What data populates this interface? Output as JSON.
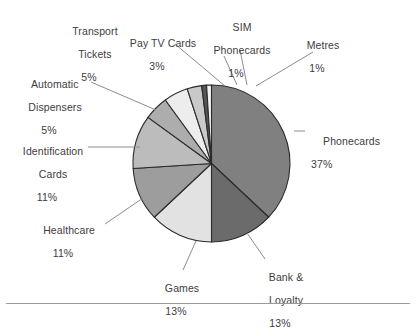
{
  "chart_data": {
    "type": "pie",
    "title": "",
    "subtitle": "",
    "xlabel": "",
    "ylabel": "",
    "legend_position": "none",
    "grid": false,
    "units": "percent",
    "total": 100,
    "start_angle_deg": 0,
    "direction": "clockwise",
    "categories": [
      "Phonecards",
      "Bank & Loyalty",
      "Games",
      "Healthcare",
      "Identification Cards",
      "Automatic Dispensers",
      "Transport Tickets",
      "Pay TV Cards",
      "SIM Phonecards",
      "Metres"
    ],
    "values": [
      37,
      13,
      13,
      11,
      11,
      5,
      5,
      3,
      1,
      1
    ],
    "slices": [
      {
        "name": "Phonecards",
        "label_line1": "Phonecards",
        "label_line2": "",
        "value": 37,
        "pct_text": "37%",
        "color": "#808080"
      },
      {
        "name": "Bank & Loyalty",
        "label_line1": "Bank &",
        "label_line2": "Loyalty",
        "value": 13,
        "pct_text": "13%",
        "color": "#6b6b6b"
      },
      {
        "name": "Games",
        "label_line1": "Games",
        "label_line2": "",
        "value": 13,
        "pct_text": "13%",
        "color": "#e2e2e2"
      },
      {
        "name": "Healthcare",
        "label_line1": "Healthcare",
        "label_line2": "",
        "value": 11,
        "pct_text": "11%",
        "color": "#9d9d9d"
      },
      {
        "name": "Identification Cards",
        "label_line1": "Identification",
        "label_line2": "Cards",
        "value": 11,
        "pct_text": "11%",
        "color": "#bcbcbc"
      },
      {
        "name": "Automatic Dispensers",
        "label_line1": "Automatic",
        "label_line2": "Dispensers",
        "value": 5,
        "pct_text": "5%",
        "color": "#adadad"
      },
      {
        "name": "Transport Tickets",
        "label_line1": "Transport",
        "label_line2": "Tickets",
        "value": 5,
        "pct_text": "5%",
        "color": "#ededed"
      },
      {
        "name": "Pay TV Cards",
        "label_line1": "Pay TV Cards",
        "label_line2": "",
        "value": 3,
        "pct_text": "3%",
        "color": "#c9c9c9"
      },
      {
        "name": "SIM Phonecards",
        "label_line1": "SIM",
        "label_line2": "Phonecards",
        "value": 1,
        "pct_text": "1%",
        "color": "#555555"
      },
      {
        "name": "Metres",
        "label_line1": "Metres",
        "label_line2": "",
        "value": 1,
        "pct_text": "1%",
        "color": "#f2f2f2"
      }
    ],
    "colors": {
      "stroke": "#2b2b2b",
      "leader_line": "#8c8c8c",
      "text": "#3d3d3d",
      "background": "#ffffff",
      "rule": "#9a9a9a"
    }
  }
}
